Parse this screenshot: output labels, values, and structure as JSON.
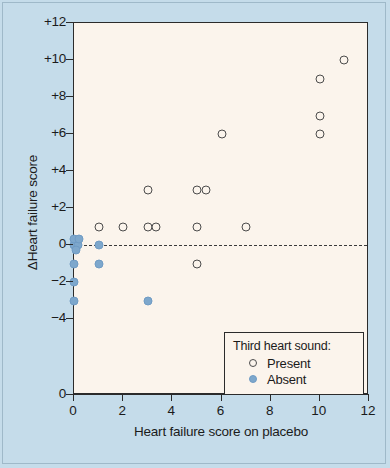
{
  "chart_data": {
    "type": "scatter",
    "title": "",
    "xlabel": "Heart failure score on placebo",
    "ylabel": "ΔHeart failure score",
    "xlim": [
      0,
      12
    ],
    "ylim": [
      -4,
      12
    ],
    "xticks": [
      0,
      2,
      4,
      6,
      8,
      10,
      12
    ],
    "xtick_labels": [
      "0",
      "2",
      "4",
      "6",
      "8",
      "10",
      "12"
    ],
    "yticks": [
      -4,
      -2,
      0,
      2,
      4,
      6,
      8,
      10,
      12
    ],
    "ytick_labels": [
      "−4",
      "−2",
      "0",
      "+2",
      "+4",
      "+6",
      "+8",
      "+10",
      "+12"
    ],
    "y_axis_break_label": "0",
    "grid": false,
    "reference_line": {
      "y": 0,
      "style": "dashed"
    },
    "legend": {
      "position": "bottom-right",
      "title": "Third heart sound:",
      "entries": [
        {
          "label": "Present",
          "marker": "open-circle",
          "color": "#fbf4ec",
          "edge": "#4c4c4c"
        },
        {
          "label": "Absent",
          "marker": "filled-circle",
          "color": "#7da7cc",
          "edge": "#6f9bc4"
        }
      ]
    },
    "series": [
      {
        "name": "Present",
        "marker": "open-circle",
        "points": [
          [
            1.0,
            1
          ],
          [
            2.0,
            1
          ],
          [
            3.0,
            1
          ],
          [
            3.35,
            1
          ],
          [
            3.0,
            3
          ],
          [
            5.0,
            1
          ],
          [
            5.0,
            3
          ],
          [
            5.35,
            3
          ],
          [
            5.0,
            -1
          ],
          [
            7.0,
            1
          ],
          [
            6.0,
            6
          ],
          [
            10.0,
            6
          ],
          [
            10.0,
            7
          ],
          [
            10.0,
            9
          ],
          [
            11.0,
            10
          ]
        ]
      },
      {
        "name": "Absent",
        "marker": "filled-circle",
        "points": [
          [
            0.0,
            0
          ],
          [
            0.15,
            0
          ],
          [
            0.0,
            0.3
          ],
          [
            0.2,
            0.3
          ],
          [
            0.1,
            -0.25
          ],
          [
            0.0,
            -1
          ],
          [
            0.0,
            -2
          ],
          [
            0.0,
            -3
          ],
          [
            1.0,
            0
          ],
          [
            1.0,
            -1
          ],
          [
            3.0,
            -3
          ]
        ]
      }
    ]
  },
  "colors": {
    "background": "#c5dcea",
    "panel": "#fbf4ec",
    "axis": "#2b2b2b",
    "absent_marker": "#7da7cc",
    "present_edge": "#4c4c4c"
  }
}
